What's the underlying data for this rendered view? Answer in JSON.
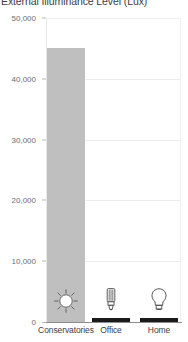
{
  "chart_data": {
    "type": "bar",
    "title": "External Illuminance Level (Lux)",
    "xlabel": "",
    "ylabel": "",
    "categories": [
      "Conservatories",
      "Office",
      "Home"
    ],
    "values": [
      45000,
      500,
      300
    ],
    "series": [
      {
        "name": "Illuminance",
        "values": [
          45000,
          500,
          300
        ]
      }
    ],
    "ylim": [
      0,
      50000
    ],
    "ytick_labels": [
      "0",
      "10,000",
      "20,000",
      "30,000",
      "40,000",
      "50,000"
    ],
    "ytick_values": [
      0,
      10000,
      20000,
      30000,
      40000,
      50000
    ],
    "grid": true,
    "legend": "none",
    "bar_colors": [
      "#bfbfbf",
      "#1a1a1a",
      "#1a1a1a"
    ],
    "bar_icons": [
      "sun-icon",
      "cfl-lamp-icon",
      "light-bulb-icon"
    ],
    "annotations": []
  },
  "colors": {
    "bar_primary": "#bfbfbf",
    "bar_dark": "#1a1a1a",
    "grid": "#ececec",
    "axis": "#8d8d8d",
    "tick_text": "#6e6e6e",
    "label_text": "#3d3d3d"
  }
}
